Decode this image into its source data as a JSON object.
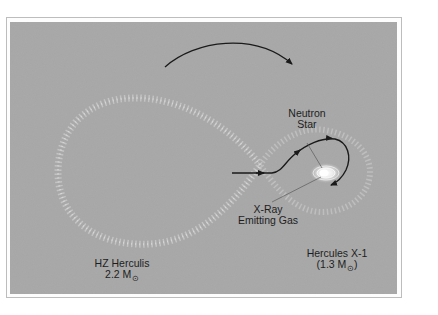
{
  "figure": {
    "title": "",
    "background_color": "#a6a6a6",
    "flow_color": "#eaeaea",
    "arrow_color": "#1a1a1a"
  },
  "labels": {
    "neutron_star_line1": "Neutron",
    "neutron_star_line2": "Star",
    "xray_line1": "X-Ray",
    "xray_line2": "Emitting Gas",
    "hz_herculis_name": "HZ Herculis",
    "hz_herculis_mass": "2.2 M",
    "hercules_x1_name": "Hercules X-1",
    "hercules_x1_mass_open": "(1.3 M",
    "hercules_x1_mass_close": ")",
    "sun_symbol": "⊙"
  },
  "elements": {
    "orbit_arrow": "orbital-motion-arrow",
    "mass_transfer_arrow": "gas-stream-arrow",
    "roche_lobe_left": "hz-herculis-roche-lobe",
    "roche_lobe_right": "hercules-x1-roche-lobe",
    "accretion_disk": "accretion-disk"
  }
}
